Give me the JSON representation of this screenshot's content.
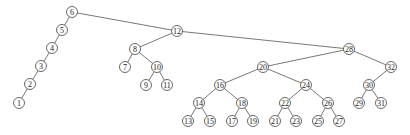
{
  "diagram": {
    "type": "binary-search-tree",
    "node_radius": 5.5,
    "nodes": [
      {
        "id": 6,
        "label": "6",
        "x": 72,
        "y": 12
      },
      {
        "id": 5,
        "label": "5",
        "x": 62,
        "y": 30
      },
      {
        "id": 4,
        "label": "4",
        "x": 52,
        "y": 48
      },
      {
        "id": 3,
        "label": "3",
        "x": 41,
        "y": 66
      },
      {
        "id": 2,
        "label": "2",
        "x": 30,
        "y": 84
      },
      {
        "id": 1,
        "label": "1",
        "x": 19,
        "y": 103
      },
      {
        "id": 12,
        "label": "12",
        "x": 177,
        "y": 31
      },
      {
        "id": 8,
        "label": "8",
        "x": 135,
        "y": 49
      },
      {
        "id": 7,
        "label": "7",
        "x": 125,
        "y": 67
      },
      {
        "id": 10,
        "label": "10",
        "x": 157,
        "y": 67
      },
      {
        "id": 9,
        "label": "9",
        "x": 146,
        "y": 85
      },
      {
        "id": 11,
        "label": "11",
        "x": 167,
        "y": 85
      },
      {
        "id": 28,
        "label": "28",
        "x": 349,
        "y": 49
      },
      {
        "id": 20,
        "label": "20",
        "x": 263,
        "y": 67
      },
      {
        "id": 16,
        "label": "16",
        "x": 220,
        "y": 85
      },
      {
        "id": 24,
        "label": "24",
        "x": 306,
        "y": 85
      },
      {
        "id": 14,
        "label": "14",
        "x": 199,
        "y": 103
      },
      {
        "id": 18,
        "label": "18",
        "x": 242,
        "y": 103
      },
      {
        "id": 22,
        "label": "22",
        "x": 285,
        "y": 103
      },
      {
        "id": 26,
        "label": "26",
        "x": 328,
        "y": 103
      },
      {
        "id": 13,
        "label": "13",
        "x": 188,
        "y": 121
      },
      {
        "id": 15,
        "label": "15",
        "x": 210,
        "y": 121
      },
      {
        "id": 17,
        "label": "17",
        "x": 232,
        "y": 121
      },
      {
        "id": 19,
        "label": "19",
        "x": 253,
        "y": 121
      },
      {
        "id": 21,
        "label": "21",
        "x": 275,
        "y": 121
      },
      {
        "id": 23,
        "label": "23",
        "x": 296,
        "y": 121
      },
      {
        "id": 25,
        "label": "25",
        "x": 318,
        "y": 121
      },
      {
        "id": 27,
        "label": "27",
        "x": 339,
        "y": 121
      },
      {
        "id": 32,
        "label": "32",
        "x": 391,
        "y": 67
      },
      {
        "id": 30,
        "label": "30",
        "x": 369,
        "y": 85
      },
      {
        "id": 29,
        "label": "29",
        "x": 359,
        "y": 103
      },
      {
        "id": 31,
        "label": "31",
        "x": 381,
        "y": 103
      }
    ],
    "edges": [
      [
        6,
        5
      ],
      [
        5,
        4
      ],
      [
        4,
        3
      ],
      [
        3,
        2
      ],
      [
        2,
        1
      ],
      [
        6,
        12
      ],
      [
        12,
        8
      ],
      [
        8,
        7
      ],
      [
        8,
        10
      ],
      [
        10,
        9
      ],
      [
        10,
        11
      ],
      [
        12,
        28
      ],
      [
        28,
        20
      ],
      [
        20,
        16
      ],
      [
        20,
        24
      ],
      [
        16,
        14
      ],
      [
        16,
        18
      ],
      [
        24,
        22
      ],
      [
        24,
        26
      ],
      [
        14,
        13
      ],
      [
        14,
        15
      ],
      [
        18,
        17
      ],
      [
        18,
        19
      ],
      [
        22,
        21
      ],
      [
        22,
        23
      ],
      [
        26,
        25
      ],
      [
        26,
        27
      ],
      [
        28,
        32
      ],
      [
        32,
        30
      ],
      [
        30,
        29
      ],
      [
        30,
        31
      ]
    ]
  }
}
